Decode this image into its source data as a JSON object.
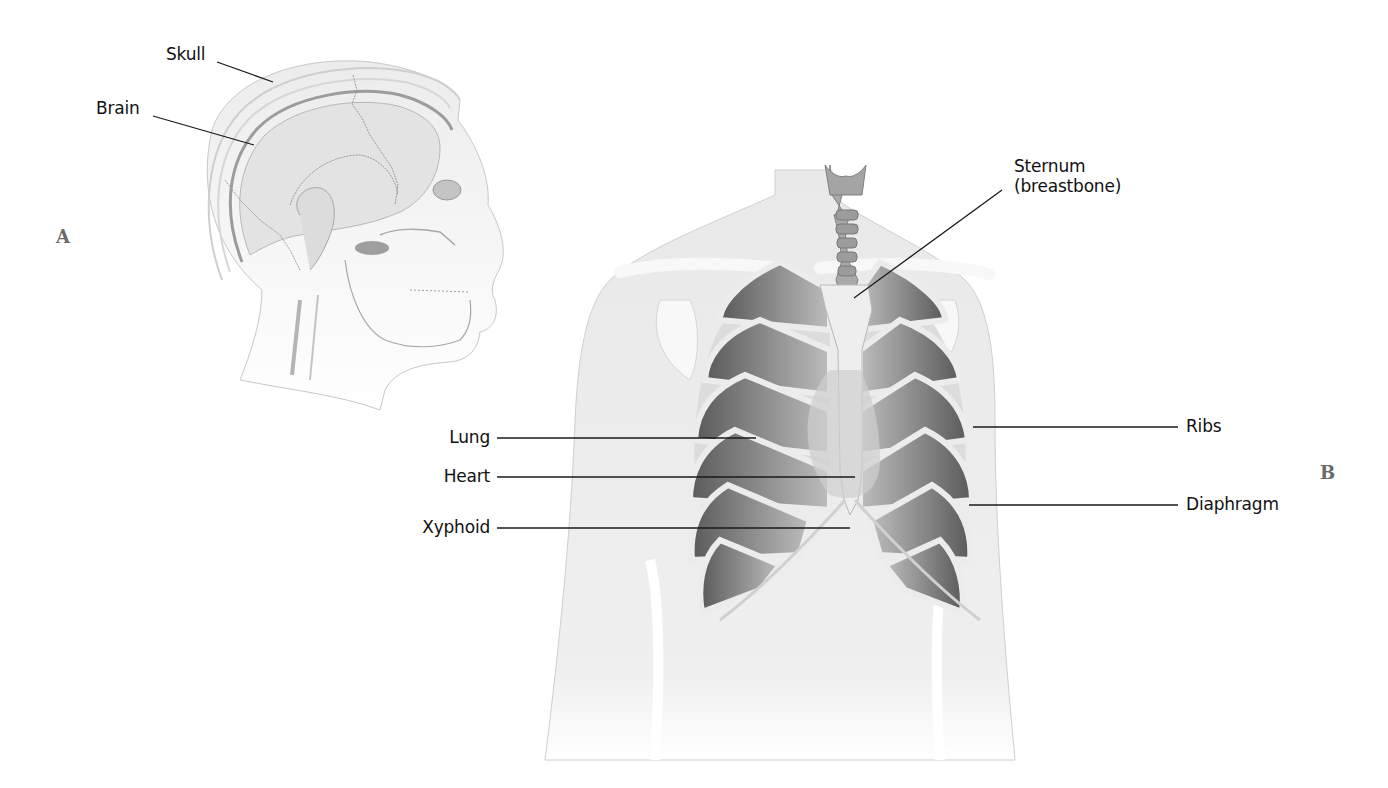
{
  "figure": {
    "panels": [
      {
        "letter": "A",
        "subject": "head-lateral-view",
        "labels": [
          {
            "text": "Skull"
          },
          {
            "text": "Brain"
          }
        ]
      },
      {
        "letter": "B",
        "subject": "thorax-anterior-view",
        "labels": [
          {
            "text": "Sternum"
          },
          {
            "text": "(breastbone)"
          },
          {
            "text": "Lung"
          },
          {
            "text": "Heart"
          },
          {
            "text": "Xyphoid"
          },
          {
            "text": "Ribs"
          },
          {
            "text": "Diaphragm"
          }
        ]
      }
    ],
    "colors": {
      "background": "#ffffff",
      "skin": "#ececec",
      "bone": "#f6f6f6",
      "rib_shadow": "#7a7a7a",
      "leader_line": "#1a1a1a",
      "label_text": "#111111",
      "panel_letter": "#6a6a6a"
    }
  }
}
